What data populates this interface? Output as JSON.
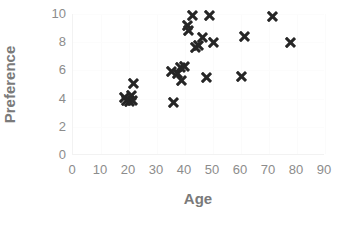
{
  "chart_data": {
    "type": "scatter",
    "title": "",
    "xlabel": "Age",
    "ylabel": "Preference",
    "xlim": [
      0,
      90
    ],
    "ylim": [
      0,
      10
    ],
    "xticks": [
      0,
      10,
      20,
      30,
      40,
      50,
      60,
      70,
      80,
      90
    ],
    "yticks": [
      0,
      2,
      4,
      6,
      8,
      10
    ],
    "grid": false,
    "legend": null,
    "marker": "x",
    "marker_color": "#262626",
    "axis_color": "#8c8c8c",
    "label_color": "#7a7a7a",
    "background": "#ffffff",
    "series": [
      {
        "name": "Age vs Preference",
        "points": [
          {
            "x": 18.5,
            "y": 4.1
          },
          {
            "x": 19.5,
            "y": 3.9
          },
          {
            "x": 20.5,
            "y": 3.8
          },
          {
            "x": 21.0,
            "y": 4.2
          },
          {
            "x": 21.5,
            "y": 3.9
          },
          {
            "x": 22.0,
            "y": 5.1
          },
          {
            "x": 35.5,
            "y": 5.9
          },
          {
            "x": 36.0,
            "y": 3.7
          },
          {
            "x": 37.5,
            "y": 5.8
          },
          {
            "x": 38.5,
            "y": 6.2
          },
          {
            "x": 39.0,
            "y": 5.3
          },
          {
            "x": 40.0,
            "y": 6.3
          },
          {
            "x": 41.0,
            "y": 9.2
          },
          {
            "x": 41.5,
            "y": 8.8
          },
          {
            "x": 43.0,
            "y": 9.9
          },
          {
            "x": 44.0,
            "y": 7.6
          },
          {
            "x": 45.0,
            "y": 7.8
          },
          {
            "x": 46.5,
            "y": 8.3
          },
          {
            "x": 48.0,
            "y": 5.5
          },
          {
            "x": 49.0,
            "y": 9.9
          },
          {
            "x": 50.5,
            "y": 8.0
          },
          {
            "x": 60.5,
            "y": 5.6
          },
          {
            "x": 61.5,
            "y": 8.4
          },
          {
            "x": 71.5,
            "y": 9.8
          },
          {
            "x": 78.0,
            "y": 8.0
          }
        ]
      }
    ]
  }
}
